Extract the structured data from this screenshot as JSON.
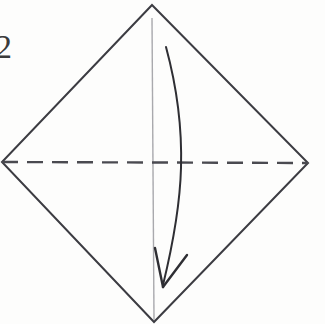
{
  "figure": {
    "kind": "origami-step-diagram",
    "step_number": "2",
    "width": 325,
    "height": 324,
    "background_color": "#fdfdfc"
  },
  "colors": {
    "paper_edge": "#3c3c42",
    "fold_line_dashed": "#4a4a50",
    "center_line": "#a9a9ad",
    "arrow": "#2e2e33",
    "label_text": "#3a3a3a"
  },
  "shape": {
    "name": "square-rotated-45-diamond",
    "vertices": {
      "top": {
        "x": 152,
        "y": 5
      },
      "right": {
        "x": 308,
        "y": 163
      },
      "bottom": {
        "x": 154,
        "y": 322
      },
      "left": {
        "x": 2,
        "y": 162
      }
    },
    "outline_path": "M 152 5 L 308 163 L 154 322 L 2 162 Z",
    "stroke_width": 2
  },
  "fold_line": {
    "name": "horizontal-valley-fold",
    "style": "dashed",
    "from": {
      "x": 2,
      "y": 162
    },
    "to": {
      "x": 308,
      "y": 163
    },
    "dash_length": 16,
    "gap_length": 9,
    "stroke_width": 2.4
  },
  "center_line": {
    "name": "vertical-center-crease",
    "style": "solid-light",
    "from": {
      "x": 152,
      "y": 18
    },
    "to": {
      "x": 154,
      "y": 320
    },
    "stroke_width": 1.4
  },
  "arrow": {
    "name": "fold-down-arrow",
    "direction": "downward",
    "start": {
      "x": 166,
      "y": 47
    },
    "end": {
      "x": 163,
      "y": 285
    },
    "bulge_x": 181,
    "bulge_y": 165,
    "path": "M 166 47 C 179 95 182 135 181 168 C 180 206 172 248 163 285",
    "stroke_width": 2,
    "head": {
      "tip": {
        "x": 163,
        "y": 287
      },
      "left_barb": {
        "x": 155,
        "y": 248
      },
      "right_barb": {
        "x": 187,
        "y": 255
      },
      "style": "open-v-barb"
    }
  },
  "labels": {
    "step": "2"
  }
}
